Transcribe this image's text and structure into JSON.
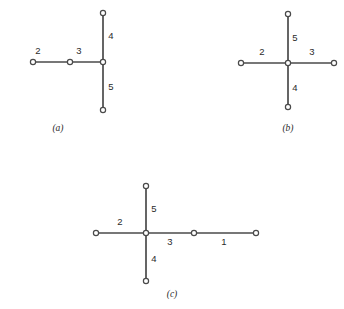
{
  "figure": {
    "background_color": "#ffffff",
    "line_color": "#4a4a4a",
    "node_fill_color": "#ffffff",
    "text_color": "#2b2b2b",
    "node_radius": 2.6,
    "panels": [
      {
        "id": "a",
        "caption": "(a)",
        "caption_x": 58,
        "caption_y": 131,
        "center": {
          "x": 103,
          "y": 62
        },
        "edges": [
          {
            "name": "edge-2",
            "label": "2",
            "x1": 33,
            "y1": 62,
            "x2": 70,
            "y2": 62,
            "label_x": 38,
            "label_y": 54
          },
          {
            "name": "edge-3",
            "label": "3",
            "x1": 70,
            "y1": 62,
            "x2": 103,
            "y2": 62,
            "label_x": 79,
            "label_y": 54
          },
          {
            "name": "edge-4",
            "label": "4",
            "x1": 103,
            "y1": 13,
            "x2": 103,
            "y2": 62,
            "label_x": 111,
            "label_y": 39
          },
          {
            "name": "edge-5",
            "label": "5",
            "x1": 103,
            "y1": 62,
            "x2": 103,
            "y2": 110,
            "label_x": 111,
            "label_y": 90
          }
        ],
        "nodes": [
          {
            "name": "node-left-end",
            "x": 33,
            "y": 62
          },
          {
            "name": "node-mid-left",
            "x": 70,
            "y": 62
          },
          {
            "name": "node-center",
            "x": 103,
            "y": 62
          },
          {
            "name": "node-top-end",
            "x": 103,
            "y": 13
          },
          {
            "name": "node-bottom-end",
            "x": 103,
            "y": 110
          }
        ]
      },
      {
        "id": "b",
        "caption": "(b)",
        "caption_x": 288,
        "caption_y": 131,
        "center": {
          "x": 288,
          "y": 63
        },
        "edges": [
          {
            "name": "edge-2",
            "label": "2",
            "x1": 241,
            "y1": 63,
            "x2": 288,
            "y2": 63,
            "label_x": 262,
            "label_y": 55
          },
          {
            "name": "edge-3",
            "label": "3",
            "x1": 288,
            "y1": 63,
            "x2": 334,
            "y2": 63,
            "label_x": 312,
            "label_y": 55
          },
          {
            "name": "edge-5",
            "label": "5",
            "x1": 288,
            "y1": 14,
            "x2": 288,
            "y2": 63,
            "label_x": 295,
            "label_y": 41
          },
          {
            "name": "edge-4",
            "label": "4",
            "x1": 288,
            "y1": 63,
            "x2": 288,
            "y2": 107,
            "label_x": 295,
            "label_y": 91
          }
        ],
        "nodes": [
          {
            "name": "node-left-end",
            "x": 241,
            "y": 63
          },
          {
            "name": "node-center",
            "x": 288,
            "y": 63
          },
          {
            "name": "node-right-end",
            "x": 334,
            "y": 63
          },
          {
            "name": "node-top-end",
            "x": 288,
            "y": 14
          },
          {
            "name": "node-bottom-end",
            "x": 288,
            "y": 107
          }
        ]
      },
      {
        "id": "c",
        "caption": "(c)",
        "caption_x": 172,
        "caption_y": 297,
        "center": {
          "x": 146,
          "y": 233
        },
        "edges": [
          {
            "name": "edge-2",
            "label": "2",
            "x1": 96,
            "y1": 233,
            "x2": 146,
            "y2": 233,
            "label_x": 120,
            "label_y": 225
          },
          {
            "name": "edge-3",
            "label": "3",
            "x1": 146,
            "y1": 233,
            "x2": 194,
            "y2": 233,
            "label_x": 170,
            "label_y": 245
          },
          {
            "name": "edge-1",
            "label": "1",
            "x1": 194,
            "y1": 233,
            "x2": 256,
            "y2": 233,
            "label_x": 224,
            "label_y": 245
          },
          {
            "name": "edge-5",
            "label": "5",
            "x1": 146,
            "y1": 186,
            "x2": 146,
            "y2": 233,
            "label_x": 154,
            "label_y": 212
          },
          {
            "name": "edge-4",
            "label": "4",
            "x1": 146,
            "y1": 233,
            "x2": 146,
            "y2": 281,
            "label_x": 154,
            "label_y": 262
          }
        ],
        "nodes": [
          {
            "name": "node-left-end",
            "x": 96,
            "y": 233
          },
          {
            "name": "node-center",
            "x": 146,
            "y": 233
          },
          {
            "name": "node-mid-right",
            "x": 194,
            "y": 233
          },
          {
            "name": "node-right-end",
            "x": 256,
            "y": 233
          },
          {
            "name": "node-top-end",
            "x": 146,
            "y": 186
          },
          {
            "name": "node-bottom-end",
            "x": 146,
            "y": 281
          }
        ]
      }
    ]
  }
}
